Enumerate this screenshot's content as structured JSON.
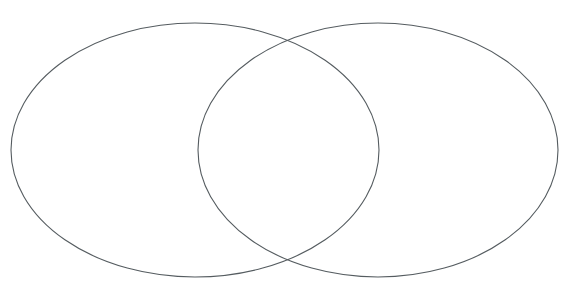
{
  "figure": {
    "kind": "venn-diagram",
    "title": "",
    "caption": "",
    "width": 579,
    "height": 308,
    "background_color": "#ffffff",
    "stroke_color": "#555c60",
    "stroke_width": 1.1,
    "fill": "none"
  },
  "chart_data": {
    "type": "diagram",
    "subtype": "venn",
    "title": "",
    "xlabel": "",
    "ylabel": "",
    "grid": false,
    "legend": "none",
    "set_count": 2,
    "shapes": [
      {
        "name": "left-set",
        "label": "",
        "shape": "ellipse",
        "cx": 195,
        "cy": 150,
        "rx": 184,
        "ry": 127,
        "stroke": "#555c60",
        "stroke_width": 1.1,
        "fill": "none"
      },
      {
        "name": "right-set",
        "label": "",
        "shape": "ellipse",
        "cx": 378,
        "cy": 150,
        "rx": 180,
        "ry": 127,
        "stroke": "#555c60",
        "stroke_width": 1.1,
        "fill": "none"
      }
    ],
    "regions": [
      {
        "name": "left-only",
        "label": "",
        "value": null
      },
      {
        "name": "intersection",
        "label": "",
        "value": null
      },
      {
        "name": "right-only",
        "label": "",
        "value": null
      }
    ],
    "intersection_points": [
      {
        "x": 289,
        "y": 38
      },
      {
        "x": 290,
        "y": 261
      }
    ],
    "extents": {
      "left_ellipse_x": [
        11,
        379
      ],
      "right_ellipse_x": [
        198,
        558
      ],
      "ellipse_y": [
        23,
        277
      ]
    }
  }
}
